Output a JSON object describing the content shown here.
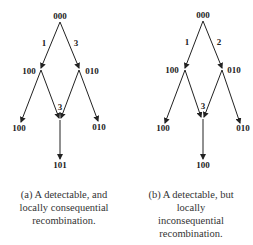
{
  "diagrams": [
    {
      "id": "a",
      "nodes": {
        "root": "000",
        "left": "100",
        "right": "010",
        "bottom_left": "100",
        "bottom_right": "010",
        "bottom": "101"
      },
      "edge_labels": {
        "root_left": "1",
        "root_right": "3",
        "merge": "3"
      },
      "caption": [
        "(a) A detectable, and",
        "locally consequential",
        "recombination."
      ]
    },
    {
      "id": "b",
      "nodes": {
        "root": "000",
        "left": "100",
        "right": "010",
        "bottom_left": "100",
        "bottom_right": "010",
        "bottom": "100"
      },
      "edge_labels": {
        "root_left": "1",
        "root_right": "2",
        "merge": "3"
      },
      "caption": [
        "(b) A detectable, but",
        "locally",
        "inconsequential",
        "recombination."
      ]
    }
  ]
}
